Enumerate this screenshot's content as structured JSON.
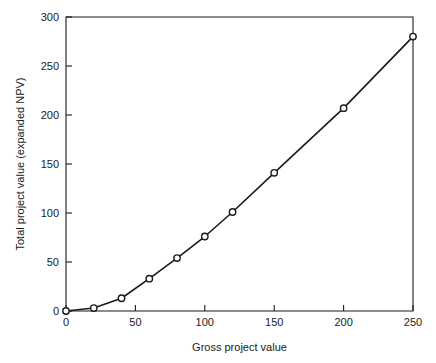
{
  "chart_data": {
    "type": "line",
    "title": "",
    "xlabel": "Gross project value",
    "ylabel": "Total project value (expanded NPV)",
    "xlim": [
      0,
      250
    ],
    "ylim": [
      0,
      300
    ],
    "xticks": [
      0,
      50,
      100,
      150,
      200,
      250
    ],
    "yticks": [
      0,
      50,
      100,
      150,
      200,
      250,
      300
    ],
    "xtick_labels": [
      "0",
      "50",
      "100",
      "150",
      "200",
      "250"
    ],
    "ytick_labels": [
      "0",
      "50",
      "100",
      "150",
      "200",
      "250",
      "300"
    ],
    "grid": false,
    "legend": null,
    "marker": "circle-open",
    "line_color": "#1a1a1a",
    "marker_face_color": "#ffffff",
    "marker_edge_color": "#1a1a1a",
    "series": [
      {
        "name": "Total project value",
        "x": [
          0,
          20,
          40,
          60,
          80,
          100,
          120,
          150,
          200,
          250
        ],
        "values": [
          0,
          3,
          13,
          33,
          54,
          76,
          101,
          141,
          207,
          280
        ]
      }
    ]
  },
  "axes": {
    "x_axis_title": "Gross project value",
    "y_axis_title": "Total project value (expanded NPV)"
  }
}
